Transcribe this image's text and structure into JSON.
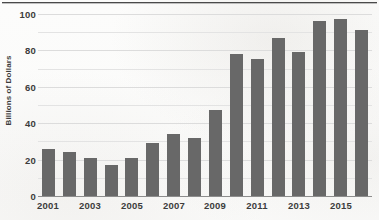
{
  "chart_data": {
    "type": "bar",
    "title": "",
    "subtitle": "",
    "xlabel": "",
    "ylabel": "Billions of Dollars",
    "ylim": [
      0,
      100
    ],
    "ytick_labels": [
      "0",
      "20",
      "40",
      "60",
      "80",
      "100"
    ],
    "ytick_values": [
      0,
      20,
      40,
      60,
      80,
      100
    ],
    "gridlines": true,
    "gridline_values": [
      10,
      20,
      30,
      40,
      50,
      60,
      70,
      80,
      90,
      100
    ],
    "legend": null,
    "legend_position": "none",
    "bar_color": "#686868",
    "categories": [
      "2001",
      "2002",
      "2003",
      "2004",
      "2005",
      "2006",
      "2007",
      "2008",
      "2009",
      "2010",
      "2011",
      "2012",
      "2013",
      "2014",
      "2015",
      "2016"
    ],
    "xtick_labels_shown": [
      "2001",
      "2003",
      "2005",
      "2007",
      "2009",
      "2011",
      "2013",
      "2015"
    ],
    "values": [
      26,
      24,
      21,
      17,
      21,
      29,
      34,
      32,
      47,
      78,
      75,
      87,
      79,
      96,
      97,
      91
    ],
    "annotations": []
  },
  "axes": {
    "y_title": "Billions of Dollars",
    "y_ticks": [
      {
        "label": "100",
        "value": 100
      },
      {
        "label": "80",
        "value": 80
      },
      {
        "label": "60",
        "value": 60
      },
      {
        "label": "40",
        "value": 40
      },
      {
        "label": "20",
        "value": 20
      },
      {
        "label": "0",
        "value": 0
      }
    ],
    "x_ticks": [
      {
        "label": "2001",
        "index": 0
      },
      {
        "label": "2003",
        "index": 2
      },
      {
        "label": "2005",
        "index": 4
      },
      {
        "label": "2007",
        "index": 6
      },
      {
        "label": "2009",
        "index": 8
      },
      {
        "label": "2011",
        "index": 10
      },
      {
        "label": "2013",
        "index": 12
      },
      {
        "label": "2015",
        "index": 14
      }
    ]
  },
  "colors": {
    "bar": "#686868",
    "axis": "#8d8d8d",
    "grid": "#e3e3e3",
    "text": "#3c3c3c",
    "rule": "#4a4a4a",
    "background": "#fdfdfd"
  }
}
